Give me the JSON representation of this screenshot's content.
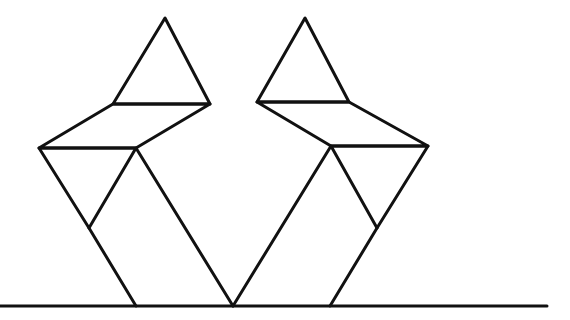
{
  "figure": {
    "stroke_color": "#111111",
    "background_color": "#ffffff"
  },
  "ground_line": {
    "x1": 0,
    "y1": 306,
    "x2": 547,
    "y2": 306
  },
  "left_figure": {
    "head_triangle": [
      [
        165,
        18
      ],
      [
        113,
        104
      ],
      [
        210,
        104
      ]
    ],
    "shoulder_parallelogram": [
      [
        113,
        104
      ],
      [
        210,
        104
      ],
      [
        136,
        148
      ],
      [
        39,
        148
      ]
    ],
    "body_left_triangle": [
      [
        39,
        148
      ],
      [
        136,
        148
      ],
      [
        89,
        228
      ]
    ],
    "leg_left": [
      [
        89,
        228
      ],
      [
        136,
        306
      ]
    ],
    "leg_right": [
      [
        136,
        148
      ],
      [
        233,
        306
      ]
    ]
  },
  "right_figure": {
    "head_triangle": [
      [
        305,
        18
      ],
      [
        257,
        102
      ],
      [
        349,
        102
      ]
    ],
    "shoulder_parallelogram": [
      [
        257,
        102
      ],
      [
        349,
        102
      ],
      [
        428,
        146
      ],
      [
        331,
        146
      ]
    ],
    "body_right_triangle": [
      [
        331,
        146
      ],
      [
        428,
        146
      ],
      [
        377,
        228
      ]
    ],
    "leg_right": [
      [
        377,
        228
      ],
      [
        330,
        306
      ]
    ],
    "leg_left": [
      [
        331,
        146
      ],
      [
        233,
        306
      ]
    ]
  }
}
